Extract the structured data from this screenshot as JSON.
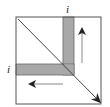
{
  "diagram": {
    "type": "matrix-traversal",
    "labels": {
      "column_index": "i",
      "row_index": "i"
    },
    "colors": {
      "border": "#555555",
      "shade": "#a8a8a8",
      "shade_edge": "#666666",
      "diagonal": "#333333",
      "arrow": "#222222",
      "arrow_shaft": "#888888"
    },
    "elements": [
      {
        "name": "matrix-square",
        "x": 16,
        "y": 17,
        "w": 85,
        "h": 87
      },
      {
        "name": "shaded-column",
        "x": 63,
        "y": 17,
        "w": 11,
        "h": 58
      },
      {
        "name": "shaded-row",
        "x": 16,
        "y": 64,
        "w": 58,
        "h": 11
      },
      {
        "name": "diagonal-arrow",
        "from": [
          18,
          19
        ],
        "to": [
          100,
          102
        ]
      },
      {
        "name": "up-arrow",
        "from": [
          82,
          62
        ],
        "to": [
          82,
          27
        ]
      },
      {
        "name": "left-arrow",
        "from": [
          63,
          84
        ],
        "to": [
          28,
          84
        ]
      }
    ]
  }
}
